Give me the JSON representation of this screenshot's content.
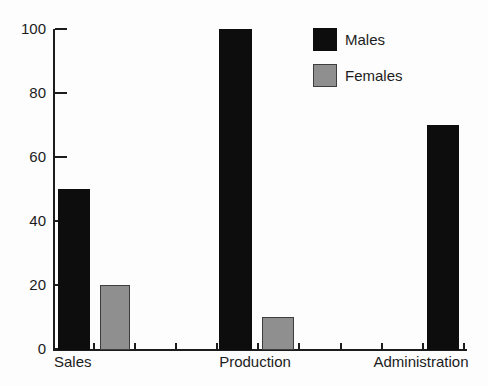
{
  "chart_data": {
    "type": "bar",
    "title": "",
    "categories": [
      "Sales",
      "Production",
      "Administration"
    ],
    "series": [
      {
        "name": "Males",
        "color": "#0d0d0d",
        "values": [
          50,
          100,
          70
        ]
      },
      {
        "name": "Females",
        "color": "#8f8f8f",
        "values": [
          20,
          10,
          0
        ]
      }
    ],
    "xlabel": "",
    "ylabel": "",
    "ylim": [
      0,
      100
    ],
    "yticks": [
      0,
      20,
      40,
      60,
      80,
      100
    ],
    "grid": false,
    "legend_position": "top-right"
  },
  "colors": {
    "background": "#fdfdfd",
    "axis": "#1c1c1c",
    "text": "#1c1c1c",
    "males_bar": "#0d0d0d",
    "females_bar": "#8f8f8f"
  }
}
